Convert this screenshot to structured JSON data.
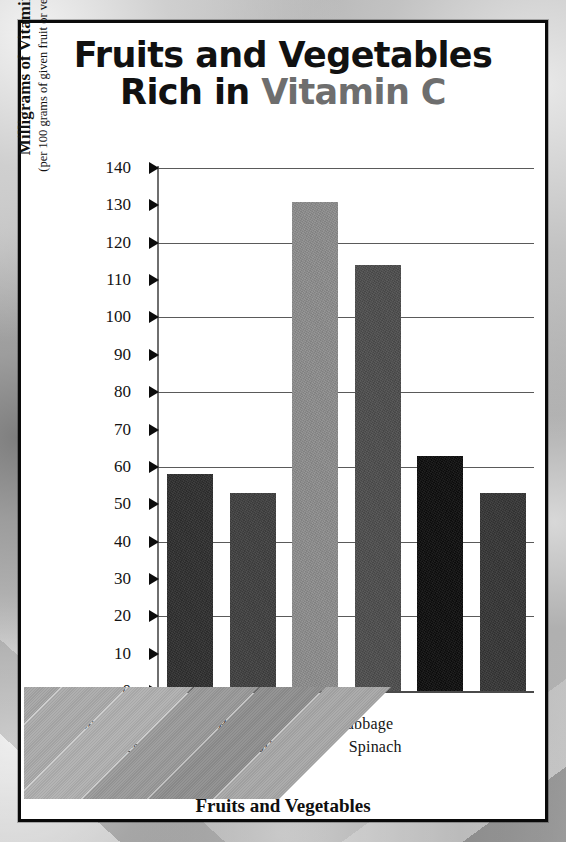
{
  "title": {
    "line1": "Fruits and Vegetables",
    "line2_prefix": "Rich in ",
    "line2_accent": "Vitamin C",
    "accent_color": "#6e6e6e"
  },
  "axes": {
    "y_title_main": "Milligrams of Vitamin C",
    "y_title_sub": "(per 100 grams of given fruit or vegetable)",
    "x_title": "Fruits and Vegetables",
    "y_ticks": [
      "140",
      "130",
      "120",
      "110",
      "100",
      "90",
      "80",
      "70",
      "60",
      "50",
      "40",
      "30",
      "20",
      "10",
      "0"
    ]
  },
  "chart_data": {
    "type": "bar",
    "title": "Fruits and Vegetables Rich in Vitamin C",
    "xlabel": "Fruits and Vegetables",
    "ylabel": "Milligrams of Vitamin C (per 100 grams of given fruit or vegetable)",
    "ylim": [
      0,
      140
    ],
    "ytick_step": 10,
    "grid": true,
    "grid_lines_at": [
      140,
      120,
      100,
      80,
      60,
      40,
      20
    ],
    "legend": "none",
    "categories": [
      "Strawberries",
      "Oranges",
      "Green Peppers",
      "Broccoli",
      "Red Cabbage",
      "Spinach"
    ],
    "values": [
      58,
      53,
      131,
      114,
      63,
      53
    ],
    "bar_colors": [
      "#2e2e2e",
      "#3f3f3f",
      "#8d8d8d",
      "#4d4d4d",
      "#0d0d0d",
      "#353535"
    ],
    "ribbon_colors": [
      "#a6a6a6",
      "#ababab",
      "#b0b0b0",
      "#9a9a9a",
      "#8f8f8f",
      "#a8a8a8"
    ]
  }
}
